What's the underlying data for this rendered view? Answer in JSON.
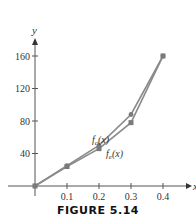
{
  "chart_data": {
    "type": "line",
    "title": "",
    "xlabel": "x",
    "ylabel": "y",
    "xlim": [
      0,
      0.4
    ],
    "ylim": [
      0,
      170
    ],
    "x_ticks": [
      "0.1",
      "0.2",
      "0.3",
      "0.4"
    ],
    "y_ticks": [
      "40",
      "80",
      "120",
      "160"
    ],
    "grid": false,
    "legend": "inline labels",
    "x": [
      0,
      0.1,
      0.2,
      0.3,
      0.4
    ],
    "series": [
      {
        "name": "f_c(x)",
        "values": [
          0,
          25,
          50,
          88,
          160
        ],
        "marker": "circle"
      },
      {
        "name": "f_e(x)",
        "values": [
          0,
          24,
          46,
          78,
          160
        ],
        "marker": "square"
      }
    ]
  },
  "labels": {
    "x_axis": "x",
    "y_axis": "y",
    "fc": "f",
    "fc_sub": "c",
    "fc_arg": "(x)",
    "fe": "f",
    "fe_sub": "e",
    "fe_arg": "(x)",
    "caption": "FIGURE 5.14"
  },
  "colors": {
    "line": "#8a8a8a",
    "axis": "#555555"
  }
}
